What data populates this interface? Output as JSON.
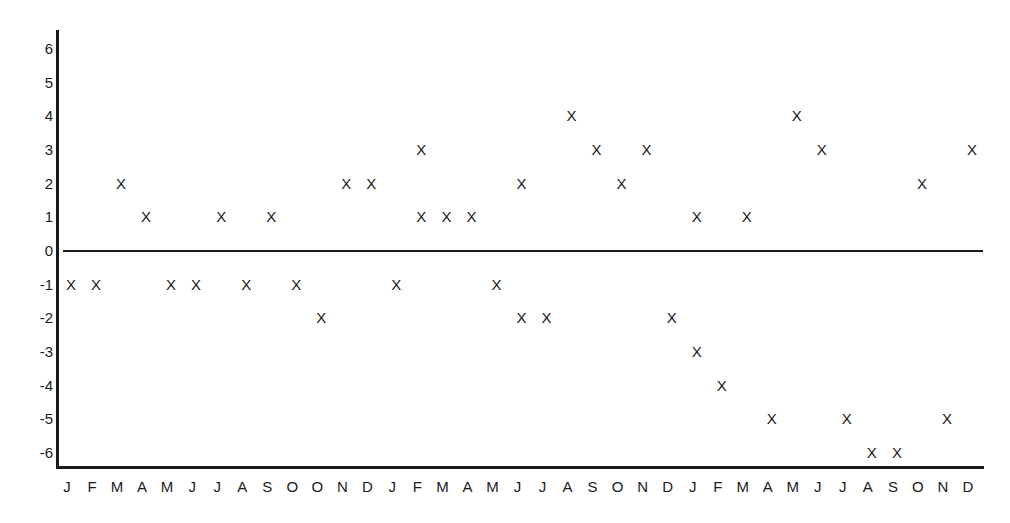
{
  "chart_data": {
    "type": "scatter",
    "title": "",
    "xlabel": "",
    "ylabel": "",
    "marker_symbol": "X",
    "grid": false,
    "legend": null,
    "ylim": [
      -6,
      6
    ],
    "y_ticks": [
      "6",
      "5",
      "4",
      "3",
      "2",
      "1",
      "0",
      "-1",
      "-2",
      "-3",
      "-4",
      "-5",
      "-6"
    ],
    "categories": [
      "J",
      "F",
      "M",
      "A",
      "M",
      "J",
      "J",
      "A",
      "S",
      "O",
      "O",
      "N",
      "D",
      "J",
      "F",
      "M",
      "A",
      "M",
      "J",
      "J",
      "A",
      "S",
      "O",
      "N",
      "D",
      "J",
      "F",
      "M",
      "A",
      "M",
      "J",
      "J",
      "A",
      "S",
      "O",
      "N",
      "D"
    ],
    "points": [
      {
        "x": 0,
        "label": "J",
        "y": -1
      },
      {
        "x": 1,
        "label": "F",
        "y": -1
      },
      {
        "x": 2,
        "label": "M",
        "y": 2
      },
      {
        "x": 3,
        "label": "A",
        "y": 1
      },
      {
        "x": 4,
        "label": "M",
        "y": -1
      },
      {
        "x": 5,
        "label": "J",
        "y": -1
      },
      {
        "x": 6,
        "label": "J",
        "y": 1
      },
      {
        "x": 7,
        "label": "A",
        "y": -1
      },
      {
        "x": 8,
        "label": "S",
        "y": 1
      },
      {
        "x": 9,
        "label": "O",
        "y": -1
      },
      {
        "x": 10,
        "label": "O",
        "y": -2
      },
      {
        "x": 11,
        "label": "N",
        "y": 2
      },
      {
        "x": 12,
        "label": "D",
        "y": 2
      },
      {
        "x": 13,
        "label": "J",
        "y": -1
      },
      {
        "x": 14,
        "label": "F",
        "y": 3
      },
      {
        "x": 14,
        "label": "F",
        "y": 1
      },
      {
        "x": 15,
        "label": "M",
        "y": 1
      },
      {
        "x": 16,
        "label": "A",
        "y": 1
      },
      {
        "x": 17,
        "label": "M",
        "y": -1
      },
      {
        "x": 18,
        "label": "J",
        "y": 2
      },
      {
        "x": 18,
        "label": "J",
        "y": -2
      },
      {
        "x": 19,
        "label": "J",
        "y": -2
      },
      {
        "x": 20,
        "label": "A",
        "y": 4
      },
      {
        "x": 21,
        "label": "S",
        "y": 3
      },
      {
        "x": 22,
        "label": "O",
        "y": 2
      },
      {
        "x": 23,
        "label": "N",
        "y": 3
      },
      {
        "x": 24,
        "label": "D",
        "y": -2
      },
      {
        "x": 25,
        "label": "J",
        "y": 1
      },
      {
        "x": 25,
        "label": "J",
        "y": -3
      },
      {
        "x": 26,
        "label": "F",
        "y": -4
      },
      {
        "x": 27,
        "label": "M",
        "y": 1
      },
      {
        "x": 28,
        "label": "A",
        "y": -5
      },
      {
        "x": 29,
        "label": "M",
        "y": 4
      },
      {
        "x": 30,
        "label": "J",
        "y": 3
      },
      {
        "x": 31,
        "label": "J",
        "y": -5
      },
      {
        "x": 32,
        "label": "A",
        "y": -6
      },
      {
        "x": 33,
        "label": "S",
        "y": -6
      },
      {
        "x": 34,
        "label": "O",
        "y": 2
      },
      {
        "x": 35,
        "label": "N",
        "y": -5
      },
      {
        "x": 36,
        "label": "D",
        "y": 3
      }
    ],
    "reference_line": {
      "y": 0,
      "style": "solid"
    },
    "colors": {
      "ink": "#1a1a1a",
      "background": "#ffffff"
    }
  }
}
